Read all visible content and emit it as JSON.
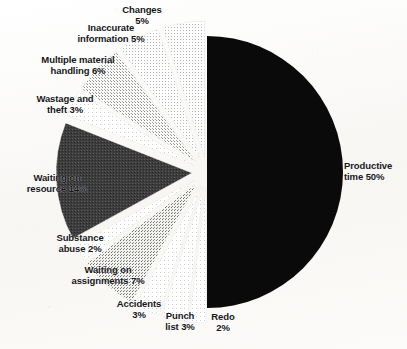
{
  "chart_data": {
    "type": "pie",
    "title": "",
    "subtitle": "",
    "xlabel": "",
    "ylabel": "",
    "legend_position": "none",
    "grid": false,
    "units": "percent",
    "total": 100,
    "exploded": true,
    "categories": [
      "Productive time",
      "Changes",
      "Inaccurate information",
      "Multiple material handling",
      "Wastage and theft",
      "Waiting on resource",
      "Substance abuse",
      "Waiting on assignments",
      "Accidents",
      "Punch list",
      "Redo"
    ],
    "values": [
      50,
      5,
      5,
      6,
      3,
      14,
      2,
      7,
      3,
      3,
      2
    ],
    "slices": [
      {
        "label": "Productive time",
        "value": 50,
        "display": "Productive time 50%",
        "color": "#0a0a0a",
        "exploded": false
      },
      {
        "label": "Changes",
        "value": 5,
        "display": "Changes 5%",
        "color": "#d8d8d6",
        "exploded": true
      },
      {
        "label": "Inaccurate information",
        "value": 5,
        "display": "Inaccurate information 5%",
        "color": "#c9c9c6",
        "exploded": true
      },
      {
        "label": "Multiple material handling",
        "value": 6,
        "display": "Multiple material handling 6%",
        "color": "#bdbdb9",
        "exploded": true
      },
      {
        "label": "Wastage and theft",
        "value": 3,
        "display": "Wastage and theft 3%",
        "color": "#e2e2df",
        "exploded": true
      },
      {
        "label": "Waiting on resource",
        "value": 14,
        "display": "Waiting on resource 14%",
        "color": "#49494a",
        "exploded": true
      },
      {
        "label": "Substance abuse",
        "value": 2,
        "display": "Substance abuse 2%",
        "color": "#efefec",
        "exploded": true
      },
      {
        "label": "Waiting on assignments",
        "value": 7,
        "display": "Waiting on assignments 7%",
        "color": "#9b9b97",
        "exploded": true
      },
      {
        "label": "Accidents",
        "value": 3,
        "display": "Accidents 3%",
        "color": "#eaeae7",
        "exploded": true
      },
      {
        "label": "Punch list",
        "value": 3,
        "display": "Punch list 3%",
        "color": "#f1f1ee",
        "exploded": true
      },
      {
        "label": "Redo",
        "value": 2,
        "display": "Redo 2%",
        "color": "#f4f4f1",
        "exploded": true
      }
    ]
  },
  "labels": {
    "productive_time": "Productive\ntime 50%",
    "productive_time_l1": "Productive",
    "productive_time_l2": "time 50%",
    "changes_l1": "Changes",
    "changes_l2": "5%",
    "inaccurate_l1": "Inaccurate",
    "inaccurate_l2": "information 5%",
    "multiple_material_l1": "Multiple material",
    "multiple_material_l2": "handling 6%",
    "wastage_l1": "Wastage and",
    "wastage_l2": "theft 3%",
    "waiting_resource_l1": "Waiting on",
    "waiting_resource_l2": "resource 14%",
    "substance_l1": "Substance",
    "substance_l2": "abuse 2%",
    "waiting_assign_l1": "Waiting on",
    "waiting_assign_l2": "assignments 7%",
    "accidents_l1": "Accidents",
    "accidents_l2": "3%",
    "punch_l1": "Punch",
    "punch_l2": "list 3%",
    "redo_l1": "Redo",
    "redo_l2": "2%"
  },
  "caption": {
    "text": ""
  },
  "colors": {
    "background": "#fbfbf9",
    "ink": "#15171a",
    "productive_slice": "#0a0a0a",
    "dark_slice": "#49494a",
    "mid_slice": "#9b9b97"
  }
}
